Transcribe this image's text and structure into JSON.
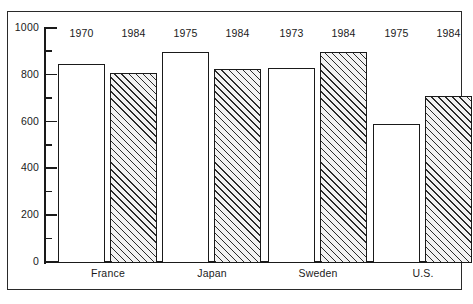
{
  "chart_data": {
    "type": "bar",
    "title": "",
    "xlabel": "",
    "ylabel": "",
    "ylim": [
      0,
      1000
    ],
    "grid": false,
    "legend": "none",
    "y_ticks_major": [
      0,
      200,
      400,
      600,
      800,
      1000
    ],
    "y_ticks_minor": [
      100,
      300,
      500,
      700,
      900
    ],
    "categories": [
      "France",
      "Japan",
      "Sweden",
      "U.S."
    ],
    "bars": [
      {
        "group": "France",
        "year": "1970",
        "value": 850,
        "fill": "open"
      },
      {
        "group": "France",
        "year": "1984",
        "value": 810,
        "fill": "hatched"
      },
      {
        "group": "Japan",
        "year": "1975",
        "value": 900,
        "fill": "open"
      },
      {
        "group": "Japan",
        "year": "1984",
        "value": 830,
        "fill": "hatched"
      },
      {
        "group": "Sweden",
        "year": "1973",
        "value": 835,
        "fill": "open"
      },
      {
        "group": "Sweden",
        "year": "1984",
        "value": 900,
        "fill": "hatched"
      },
      {
        "group": "U.S.",
        "year": "1975",
        "value": 595,
        "fill": "open"
      },
      {
        "group": "U.S.",
        "year": "1984",
        "value": 715,
        "fill": "hatched"
      }
    ],
    "series": [
      {
        "name": "earlier year",
        "values": [
          850,
          900,
          835,
          595
        ]
      },
      {
        "name": "1984",
        "values": [
          810,
          830,
          900,
          715
        ]
      }
    ],
    "colors": {
      "line": "#1a1a1a",
      "open_fill": "#ffffff",
      "hatch_fill": "#f2f2f2",
      "hatch_stroke": "#2b2b2b",
      "frame": "#2a2a2a",
      "background": "#ffffff"
    }
  },
  "y_axis": {
    "labels": [
      "1000",
      "800",
      "600",
      "400",
      "200",
      "0"
    ]
  },
  "year_labels": [
    "1970",
    "1984",
    "1975",
    "1984",
    "1973",
    "1984",
    "1975",
    "1984"
  ],
  "group_labels": [
    "France",
    "Japan",
    "Sweden",
    "U.S."
  ]
}
